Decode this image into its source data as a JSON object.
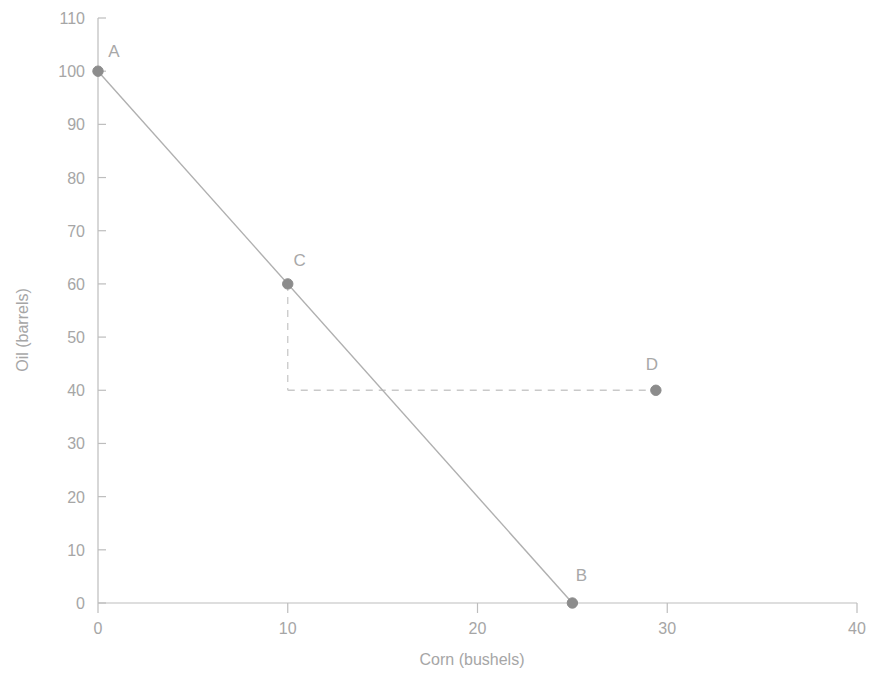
{
  "chart_data": {
    "type": "line",
    "title": "",
    "xlabel": "Corn (bushels)",
    "ylabel": "Oil (barrels)",
    "xlim": [
      0,
      40
    ],
    "ylim": [
      0,
      110
    ],
    "xticks": [
      "0",
      "10",
      "20",
      "30",
      "40"
    ],
    "xtick_values": [
      0,
      10,
      20,
      30,
      40
    ],
    "yticks": [
      "0",
      "10",
      "20",
      "30",
      "40",
      "50",
      "60",
      "70",
      "80",
      "90",
      "100",
      "110"
    ],
    "ytick_values": [
      0,
      10,
      20,
      30,
      40,
      50,
      60,
      70,
      80,
      90,
      100,
      110
    ],
    "grid": false,
    "legend": "none",
    "series": [
      {
        "name": "Production Possibilities Frontier",
        "x": [
          0,
          25
        ],
        "y": [
          100,
          0
        ],
        "style": "solid",
        "color": "#b0b0b0"
      }
    ],
    "points": [
      {
        "label": "A",
        "x": 0,
        "y": 100,
        "label_dx": 16,
        "label_dy": -14
      },
      {
        "label": "B",
        "x": 25,
        "y": 0,
        "label_dx": 9,
        "label_dy": -22
      },
      {
        "label": "C",
        "x": 10,
        "y": 60,
        "label_dx": 12,
        "label_dy": -18
      },
      {
        "label": "D",
        "x": 29.4,
        "y": 40,
        "label_dx": -4,
        "label_dy": -20
      }
    ],
    "guides": [
      {
        "name": "vertical-dashed-from-c",
        "x1": 10,
        "y1": 60,
        "x2": 10,
        "y2": 40
      },
      {
        "name": "horizontal-dashed-to-d",
        "x1": 10,
        "y1": 40,
        "x2": 29.4,
        "y2": 40
      }
    ],
    "colors": {
      "axis": "#bdbdbd",
      "line": "#b0b0b0",
      "marker": "#8c8c8c",
      "dashed": "#c9c9c9",
      "text": "#a6a6a6",
      "background": "#ffffff"
    }
  },
  "axes": {
    "x_title": "Corn (bushels)",
    "y_title": "Oil (barrels)",
    "x_tick_labels": [
      "0",
      "10",
      "20",
      "30",
      "40"
    ],
    "y_tick_labels": [
      "0",
      "10",
      "20",
      "30",
      "40",
      "50",
      "60",
      "70",
      "80",
      "90",
      "100",
      "110"
    ]
  },
  "labels": {
    "a": "A",
    "b": "B",
    "c": "C",
    "d": "D"
  }
}
